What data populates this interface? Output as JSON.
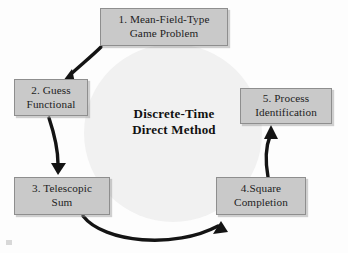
{
  "diagram": {
    "center_label": "Discrete-Time\nDirect Method",
    "background_circle_color": "#f1f1f1",
    "box_fill_color": "#c9c9c9",
    "box_border_color": "#8e8e8e",
    "arrow_color": "#141414",
    "nodes": [
      {
        "id": "1",
        "label": "1.  Mean-Field-Type\nGame Problem"
      },
      {
        "id": "2",
        "label": "2.  Guess\nFunctional"
      },
      {
        "id": "3",
        "label": "3.  Telescopic\nSum"
      },
      {
        "id": "4",
        "label": "4.Square\nCompletion"
      },
      {
        "id": "5",
        "label": "5.  Process\nIdentification"
      }
    ],
    "arrows": [
      {
        "id": "a1",
        "from": "1",
        "to": "2",
        "name": "arrow-node1-to-node2"
      },
      {
        "id": "a2",
        "from": "2",
        "to": "3",
        "name": "arrow-node2-to-node3"
      },
      {
        "id": "a3",
        "from": "3",
        "to": "4",
        "name": "arrow-node3-to-node4"
      },
      {
        "id": "a4",
        "from": "4",
        "to": "5",
        "name": "arrow-node4-to-node5"
      }
    ]
  }
}
